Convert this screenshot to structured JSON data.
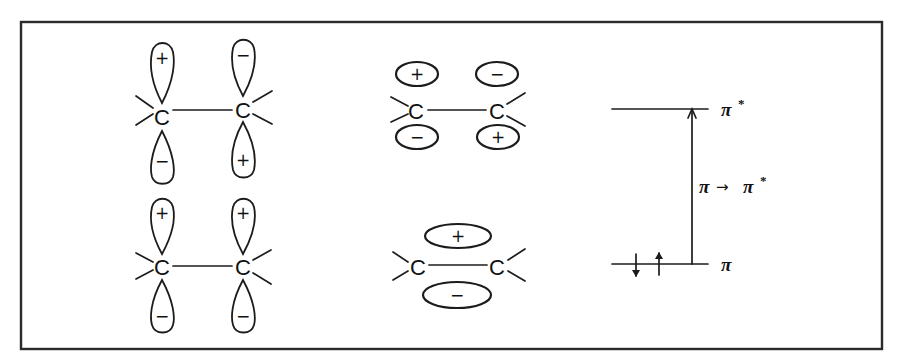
{
  "figure": {
    "p_orbital_panels": [
      {
        "id": "antibonding",
        "carbon_left": {
          "atom": "C",
          "upper_sign": "+",
          "lower_sign": "−"
        },
        "carbon_right": {
          "atom": "C",
          "upper_sign": "−",
          "lower_sign": "+"
        }
      },
      {
        "id": "bonding",
        "carbon_left": {
          "atom": "C",
          "upper_sign": "+",
          "lower_sign": "−"
        },
        "carbon_right": {
          "atom": "C",
          "upper_sign": "+",
          "lower_sign": "−"
        }
      }
    ],
    "mo_panels": [
      {
        "id": "pi-star",
        "atom_left": "C",
        "atom_right": "C",
        "top_left_sign": "+",
        "top_right_sign": "−",
        "bottom_left_sign": "−",
        "bottom_right_sign": "+"
      },
      {
        "id": "pi",
        "atom_left": "C",
        "atom_right": "C",
        "top_sign": "+",
        "bottom_sign": "−"
      }
    ],
    "energy_diagram": {
      "upper_level_label": "π",
      "upper_level_superscript": "*",
      "lower_level_label": "π",
      "transition_label_from": "π",
      "transition_arrow": "→",
      "transition_label_to": "π",
      "transition_label_superscript": "*",
      "electrons": [
        "spin-down",
        "spin-up"
      ]
    }
  }
}
